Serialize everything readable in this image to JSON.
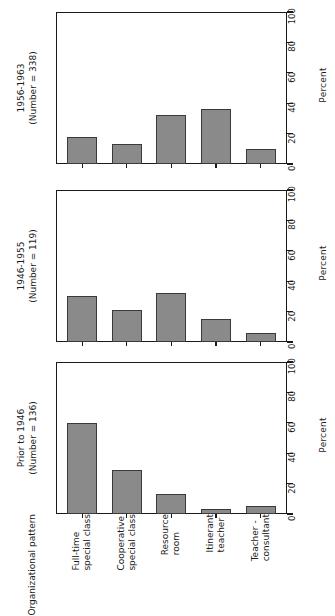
{
  "chart_data": {
    "type": "bar",
    "title": "",
    "xlabel": "Organizational pattern",
    "ylabel": "Percent",
    "ylim": [
      0,
      100
    ],
    "yticks": [
      0,
      20,
      40,
      60,
      80,
      100
    ],
    "grid": false,
    "orientation": "vertical",
    "categories": [
      "Full-time special class",
      "Cooperative special class",
      "Resource room",
      "Itinerant teacher",
      "Teacher - consultant"
    ],
    "panels": [
      {
        "id": "panel-1956-1963",
        "title_line1": "1956-1963",
        "title_line2": "(Number = 338)",
        "period": "1956-1963",
        "number": 338,
        "values": [
          18,
          13,
          32,
          36,
          10
        ]
      },
      {
        "id": "panel-1946-1955",
        "title_line1": "1946-1955",
        "title_line2": "(Number = 119)",
        "period": "1946-1955",
        "number": 119,
        "values": [
          30,
          21,
          32,
          15,
          6
        ]
      },
      {
        "id": "panel-prior-1946",
        "title_line1": "Prior to 1946",
        "title_line2": "(Number = 136)",
        "period": "Prior to 1946",
        "number": 136,
        "values": [
          60,
          29,
          13,
          3,
          5
        ]
      }
    ]
  },
  "panels": {
    "top": {
      "line1": "1956-1963",
      "line2": "(Number = 338)"
    },
    "mid": {
      "line1": "1946-1955",
      "line2": "(Number = 119)"
    },
    "bottom": {
      "line1": "Prior to 1946",
      "line2": "(Number = 136)"
    }
  },
  "axis": {
    "percent_title": "Percent",
    "ticks": {
      "t0": "0",
      "t20": "20",
      "t40": "40",
      "t60": "60",
      "t80": "80",
      "t100": "100"
    }
  },
  "xaxis": {
    "group_line1": "Organizational",
    "group_line2": "pattern",
    "cats": [
      {
        "l1": "Full-time",
        "l2": "special class"
      },
      {
        "l1": "Cooperative",
        "l2": "special class"
      },
      {
        "l1": "Resource",
        "l2": "room"
      },
      {
        "l1": "Itinerant",
        "l2": "teacher"
      },
      {
        "l1": "Teacher -",
        "l2": "consultant"
      }
    ]
  },
  "colors": {
    "bar_fill": "#8a8a8a",
    "bar_stroke": "#3a3a3a",
    "axis": "#1a1a1a",
    "background": "#ffffff"
  }
}
